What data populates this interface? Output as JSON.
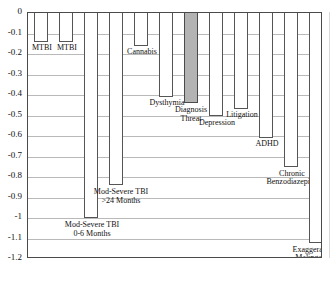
{
  "chart_data": {
    "type": "bar",
    "title": "",
    "subtitle": "",
    "xlabel": "",
    "ylabel": "",
    "ylim": [
      -1.2,
      0
    ],
    "grid": true,
    "legend_position": "none",
    "orientation": "vertical-descending",
    "y_ticks": [
      "0",
      "-0.1",
      "-0.2",
      "-0.3",
      "-0.4",
      "-0.5",
      "-0.6",
      "-0.7",
      "-0.8",
      "-0.9",
      "-1",
      "-1.1",
      "-1.2"
    ],
    "y_tick_values": [
      0,
      -0.1,
      -0.2,
      -0.3,
      -0.4,
      -0.5,
      -0.6,
      -0.7,
      -0.8,
      -0.9,
      -1,
      -1.1,
      -1.2
    ],
    "categories": [
      "MTBI",
      "MTBI",
      "Mod-Severe TBI\n0-6 Months",
      "Mod-Severe TBI\n>24 Months",
      "Cannabis",
      "Dysthymia",
      "Diagnosis\nThreat",
      "Depression",
      "Litigation",
      "ADHD",
      "Chronic\nBenzodiazepine",
      "Exaggeration/\nMalingering"
    ],
    "values": [
      -0.14,
      -0.14,
      -1.0,
      -0.84,
      -0.16,
      -0.41,
      -0.44,
      -0.5,
      -0.47,
      -0.61,
      -0.75,
      -1.12
    ],
    "highlighted_category": "Diagnosis Threat",
    "highlight_color": "#b3b3b3",
    "bar_color": "#ffffff",
    "bar_border_color": "#555555",
    "gridline_color": "#b9b9b9",
    "frame_color": "#4a4a4a"
  },
  "bars": [
    {
      "label": "MTBI",
      "value": -0.14,
      "x": 6,
      "w": 14,
      "label_x": 2,
      "label_w": 24,
      "label_dy": 2,
      "shaded": false
    },
    {
      "label": "MTBI",
      "value": -0.14,
      "x": 31,
      "w": 14,
      "label_x": 27,
      "label_w": 24,
      "label_dy": 2,
      "shaded": false
    },
    {
      "label": "Mod-Severe TBI\n0-6 Months",
      "value": -1.0,
      "x": 56,
      "w": 14,
      "label_x": 27,
      "label_w": 74,
      "label_dy": 3,
      "shaded": false
    },
    {
      "label": "Mod-Severe TBI\n>24 Months",
      "value": -0.84,
      "x": 81,
      "w": 14,
      "label_x": 57,
      "label_w": 72,
      "label_dy": 3,
      "shaded": false
    },
    {
      "label": "Cannabis",
      "value": -0.16,
      "x": 106,
      "w": 14,
      "label_x": 92,
      "label_w": 44,
      "label_dy": 2,
      "shaded": false
    },
    {
      "label": "Dysthymia",
      "value": -0.41,
      "x": 131,
      "w": 14,
      "label_x": 116,
      "label_w": 46,
      "label_dy": 2,
      "shaded": false
    },
    {
      "label": "Diagnosis\nThreat",
      "value": -0.44,
      "x": 156,
      "w": 14,
      "label_x": 137,
      "label_w": 52,
      "label_dy": 3,
      "shaded": true
    },
    {
      "label": "Depression",
      "value": -0.5,
      "x": 181,
      "w": 14,
      "label_x": 163,
      "label_w": 52,
      "label_dy": 3,
      "shaded": false
    },
    {
      "label": "Litigation",
      "value": -0.47,
      "x": 206,
      "w": 14,
      "label_x": 191,
      "label_w": 46,
      "label_dy": 2,
      "shaded": false
    },
    {
      "label": "ADHD",
      "value": -0.61,
      "x": 231,
      "w": 14,
      "label_x": 217,
      "label_w": 44,
      "label_dy": 2,
      "shaded": false
    },
    {
      "label": "Chronic\nBenzodiazepine",
      "value": -0.75,
      "x": 256,
      "w": 14,
      "label_x": 228,
      "label_w": 72,
      "label_dy": 3,
      "shaded": false
    },
    {
      "label": "Exaggeration/\nMalingering",
      "value": -1.12,
      "x": 281,
      "w": 14,
      "label_x": 249,
      "label_w": 76,
      "label_dy": 3,
      "shaded": false
    }
  ]
}
